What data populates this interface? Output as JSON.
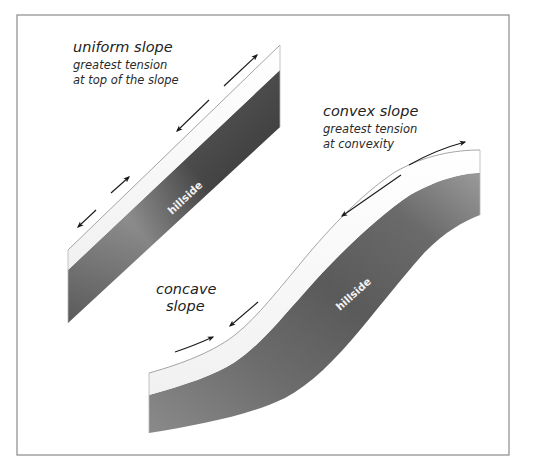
{
  "figure": {
    "uniform_slope": {
      "title": "uniform slope",
      "line1": "greatest tension",
      "line2": "at top of the slope",
      "hillside_label": "hillside"
    },
    "convex_slope": {
      "title": "convex slope",
      "line1": "greatest tension",
      "line2": "at convexity"
    },
    "concave_slope": {
      "line1": "concave",
      "line2": "slope"
    },
    "s_slope": {
      "hillside_label": "hillside"
    },
    "colors": {
      "frame": "#8a8a8a",
      "soil_layer": "#fafafa",
      "bedrock_light": "#a8a8a8",
      "bedrock_dark": "#2e2e2e",
      "arrow": "#1a1a1a",
      "text": "#222222"
    }
  }
}
